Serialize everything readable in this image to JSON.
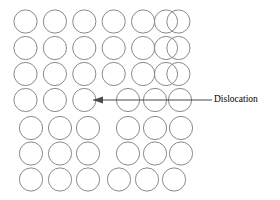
{
  "figure": {
    "background_color": "#ffffff",
    "width": 280,
    "height": 200
  },
  "lattice": {
    "atom_radius": 11.6,
    "atom_stroke_color": "#8a8a8a",
    "atom_stroke_width": 1.0,
    "atom_fill": "none",
    "column_spacing": 29.4,
    "rows": [
      {
        "id": "row-1",
        "cy": 21.5,
        "atom_count": 7,
        "centers_x": [
          25.5,
          54.9,
          84.3,
          113.7,
          143.1,
          172.5,
          178.4
        ],
        "atoms": [
          25.5,
          54.9,
          84.3,
          113.7,
          143.1,
          166.0,
          178.4
        ]
      },
      {
        "id": "row-2",
        "cy": 48.0,
        "atom_count": 7,
        "atoms": [
          25.5,
          54.9,
          84.3,
          113.7,
          143.1,
          166.0,
          178.4
        ]
      },
      {
        "id": "row-3",
        "cy": 74.0,
        "atom_count": 7,
        "atoms": [
          25.5,
          54.9,
          84.3,
          113.7,
          143.1,
          166.0,
          178.4
        ]
      },
      {
        "id": "row-4-dislocation",
        "cy": 100.0,
        "atom_count": 6,
        "atoms": [
          25.5,
          54.9,
          84.3,
          128.0,
          155.0,
          180.0
        ]
      },
      {
        "id": "row-5",
        "cy": 128.0,
        "atom_count": 6,
        "atoms": [
          31.0,
          60.0,
          88.0,
          128.0,
          155.0,
          181.0
        ]
      },
      {
        "id": "row-6",
        "cy": 153.5,
        "atom_count": 6,
        "atoms": [
          31.0,
          60.0,
          88.0,
          128.0,
          155.0,
          181.0
        ]
      },
      {
        "id": "row-7",
        "cy": 179.5,
        "atom_count": 6,
        "atoms": [
          31.0,
          60.0,
          88.0,
          119.0,
          147.0,
          174.0
        ]
      }
    ]
  },
  "annotation": {
    "label": "Dislocation",
    "label_x": 214,
    "label_y": 100,
    "label_color": "#000000",
    "arrow": {
      "color": "#4a4a4a",
      "stroke_width": 1.2,
      "tail_x": 212,
      "tail_y": 100,
      "tip_x": 93,
      "tip_y": 100,
      "head_points": "93,100 103,96.5 103,103.5"
    }
  }
}
